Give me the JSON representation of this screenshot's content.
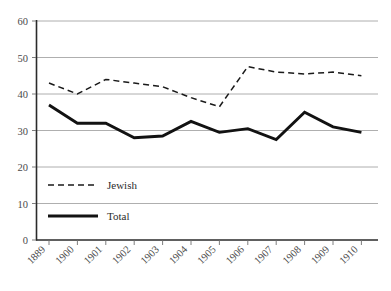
{
  "chart_data": {
    "type": "line",
    "title": "",
    "subtitle": "",
    "xlabel": "",
    "ylabel": "",
    "ylim": [
      0,
      60
    ],
    "yticks": [
      0,
      10,
      20,
      30,
      40,
      50,
      60
    ],
    "grid": "horizontal",
    "legend_position": "inside-lower-left",
    "categories": [
      "1889",
      "1900",
      "1901",
      "1902",
      "1903",
      "1904",
      "1905",
      "1906",
      "1907",
      "1908",
      "1909",
      "1910"
    ],
    "series": [
      {
        "name": "Jewish",
        "style": "dashed",
        "color": "#1a1a1a",
        "values": [
          43,
          40,
          44,
          43,
          42,
          39,
          36.5,
          47.5,
          46,
          45.5,
          46,
          45
        ]
      },
      {
        "name": "Total",
        "style": "solid-bold",
        "color": "#121212",
        "values": [
          37,
          32,
          32,
          28,
          28.5,
          32.5,
          29.5,
          30.5,
          27.5,
          35,
          31,
          29.5
        ]
      }
    ]
  },
  "axes": {
    "y_tick_labels": [
      "60",
      "50",
      "40",
      "30",
      "20",
      "10",
      "0"
    ],
    "x_tick_labels": [
      "1889",
      "1900",
      "1901",
      "1902",
      "1903",
      "1904",
      "1905",
      "1906",
      "1907",
      "1908",
      "1909",
      "1910"
    ]
  },
  "legend": {
    "entries": [
      {
        "label": "Jewish",
        "style": "dashed"
      },
      {
        "label": "Total",
        "style": "solid-bold"
      }
    ]
  }
}
